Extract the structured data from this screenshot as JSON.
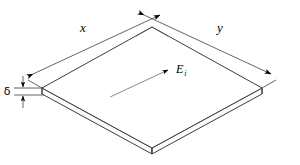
{
  "figure": {
    "background_color": "#ffffff",
    "line_color": "#3d3d3d",
    "dimension_line_color": "#555555",
    "field_line_color": "#8a8a8a",
    "arrow_color": "#000000"
  },
  "labels": {
    "x": "x",
    "y": "y",
    "delta": "δ",
    "field": "E",
    "field_subscript": "i"
  },
  "annotations": [
    {
      "name": "length-x",
      "text": "x",
      "meaning": "plate length along upper-left edge"
    },
    {
      "name": "length-y",
      "text": "y",
      "meaning": "plate width along upper-right edge"
    },
    {
      "name": "thickness-delta",
      "text": "δ",
      "meaning": "plate thickness"
    },
    {
      "name": "incident-field",
      "text": "E i",
      "meaning": "incident electric field direction on plate surface"
    }
  ],
  "geometry": {
    "top_vertex": [
      152,
      27
    ],
    "left_vertex": [
      42,
      88
    ],
    "right_vertex": [
      262,
      88
    ],
    "bottom_vertex": [
      152,
      148
    ],
    "thickness_px": 6
  }
}
